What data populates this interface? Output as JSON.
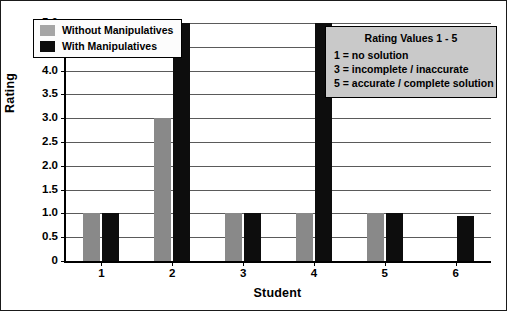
{
  "chart_data": {
    "type": "bar",
    "title": "",
    "xlabel": "Student",
    "ylabel": "Rating",
    "categories": [
      "1",
      "2",
      "3",
      "4",
      "5",
      "6"
    ],
    "series": [
      {
        "name": "Without Manipulatives",
        "color": "#898989",
        "values": [
          1,
          3,
          1,
          1,
          1,
          0
        ]
      },
      {
        "name": "With Manipulatives",
        "color": "#0d0d0d",
        "values": [
          1,
          5,
          1,
          5,
          1,
          0.95
        ]
      }
    ],
    "ylim": [
      0,
      5
    ],
    "ytick_values": [
      0,
      0.5,
      1.0,
      1.5,
      2.0,
      2.5,
      3.0,
      3.5,
      4.0,
      4.5,
      5.0
    ],
    "ytick_labels": [
      "0",
      "0.5",
      "1.0",
      "1.5",
      "2.0",
      "2.5",
      "3.0",
      "3.5",
      "4.0",
      "4.5",
      "5.0"
    ],
    "grid": true,
    "legend_position": "upper-left-inside"
  },
  "legend": {
    "items": [
      {
        "label": "Without Manipulatives",
        "swatch": "gray"
      },
      {
        "label": "With Manipulatives",
        "swatch": "black"
      }
    ]
  },
  "rating_note": {
    "title": "Rating Values 1 - 5",
    "lines": [
      "1 = no solution",
      "3 = incomplete / inaccurate",
      "5 = accurate / complete solution"
    ]
  }
}
